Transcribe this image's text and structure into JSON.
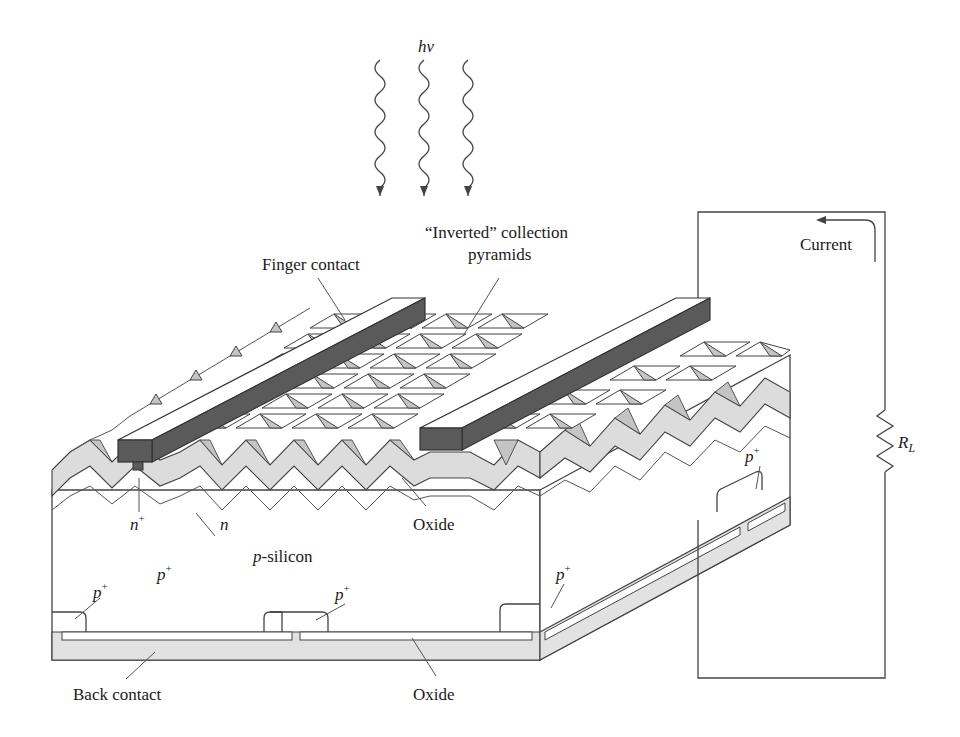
{
  "figure": {
    "type": "diagram"
  },
  "labels": {
    "photon": "hν",
    "finger_contact": "Finger contact",
    "inverted_line1": "“Inverted” collection",
    "inverted_line2": "pyramids",
    "current": "Current",
    "load_resistor": "R",
    "load_resistor_sub": "L",
    "n_plus": "n",
    "n_plus_sup": "+",
    "n_layer": "n",
    "oxide_top": "Oxide",
    "p_silicon_p": "p",
    "p_silicon_rest": "-silicon",
    "p_plus_1": "p",
    "p_plus_2": "p",
    "p_plus_3": "p",
    "p_plus_4": "p",
    "p_plus_5": "p",
    "plus": "+",
    "back_contact": "Back contact",
    "oxide_bottom": "Oxide"
  },
  "colors": {
    "contact_dark": "#5a5a5a",
    "pyramid_shade": "#c4c4c4",
    "oxide_layer": "#dcdcdc",
    "back_contact": "#e2e2e2",
    "line": "#444444"
  }
}
